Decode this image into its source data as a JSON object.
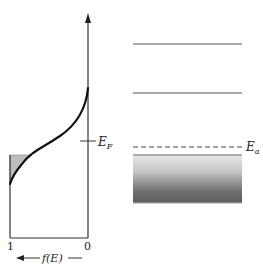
{
  "diagram": {
    "fermi_plot": {
      "x_axis_label": "f(E)",
      "x_tick_left": "1",
      "x_tick_right": "0",
      "fermi_level_label_main": "E",
      "fermi_level_label_sub": "F"
    },
    "band_diagram": {
      "acceptor_level_label_main": "E",
      "acceptor_level_label_sub": "a",
      "levels": [
        "upper level 1",
        "upper level 2",
        "acceptor level (dashed)",
        "valence band (shaded)"
      ]
    },
    "colors": {
      "line": "#1a1a1a",
      "level_line": "#555555",
      "shade_light": "#e6e6e6",
      "shade_dark": "#5a5a5a",
      "triangle_fill": "#bdbdbd"
    }
  }
}
